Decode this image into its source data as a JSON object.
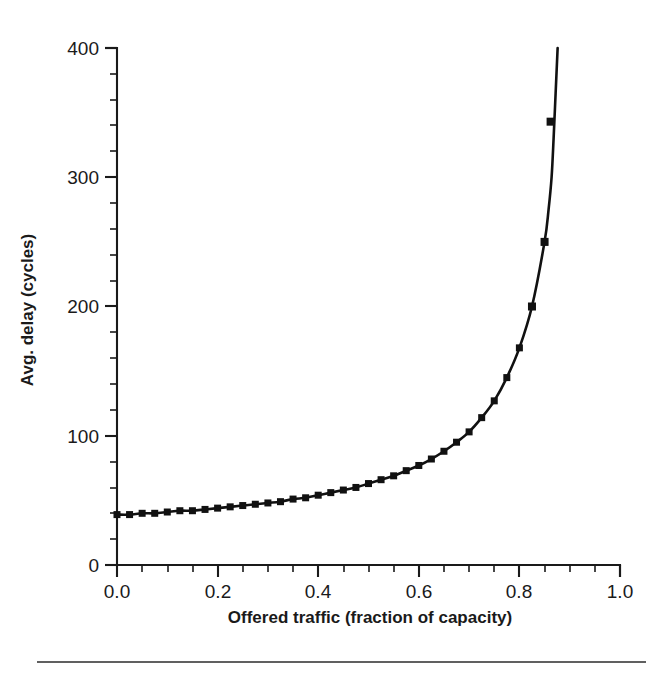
{
  "chart_data": {
    "type": "line",
    "title": "",
    "xlabel": "Offered traffic (fraction of capacity)",
    "ylabel": "Avg. delay (cycles)",
    "xlim": [
      0.0,
      1.0
    ],
    "ylim": [
      0,
      400
    ],
    "grid": false,
    "legend": null,
    "marker": "filled-square",
    "line_color": "#111111",
    "xticks": [
      0.0,
      0.2,
      0.4,
      0.6,
      0.8,
      1.0
    ],
    "xtick_labels": [
      "0.0",
      "0.2",
      "0.4",
      "0.6",
      "0.8",
      "1.0"
    ],
    "xtick_minor_step": 0.05,
    "yticks": [
      0,
      100,
      200,
      300,
      400
    ],
    "ytick_labels": [
      "0",
      "100",
      "200",
      "300",
      "400"
    ],
    "ytick_minor_step": 20,
    "series": [
      {
        "name": "Avg. delay",
        "x": [
          0.0,
          0.025,
          0.05,
          0.075,
          0.1,
          0.125,
          0.15,
          0.175,
          0.2,
          0.225,
          0.25,
          0.275,
          0.3,
          0.325,
          0.35,
          0.375,
          0.4,
          0.425,
          0.45,
          0.475,
          0.5,
          0.525,
          0.55,
          0.575,
          0.6,
          0.625,
          0.65,
          0.675,
          0.7,
          0.725,
          0.75,
          0.775,
          0.8,
          0.825,
          0.85
        ],
        "values": [
          39,
          39,
          40,
          40,
          41,
          42,
          42,
          43,
          44,
          45,
          46,
          47,
          48,
          49,
          51,
          52,
          54,
          56,
          58,
          60,
          63,
          66,
          69,
          73,
          77,
          82,
          88,
          95,
          103,
          114,
          127,
          145,
          168,
          200,
          250
        ],
        "tail_x": [
          0.85,
          0.858,
          0.864,
          0.868,
          0.872,
          0.876
        ],
        "tail_values": [
          250,
          275,
          300,
          330,
          365,
          400
        ]
      }
    ],
    "highlight_points": [
      {
        "x": 0.825,
        "y": 200
      },
      {
        "x": 0.85,
        "y": 250
      },
      {
        "x": 0.862,
        "y": 343
      }
    ]
  },
  "footer": {
    "rule": "horizontal-rule"
  }
}
